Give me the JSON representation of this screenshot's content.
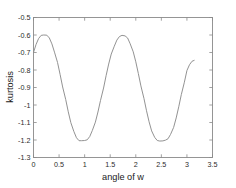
{
  "chart_data": {
    "type": "line",
    "title": "",
    "xlabel": "angle of w",
    "ylabel": "kurtosis",
    "xlim": [
      0,
      3.5
    ],
    "ylim": [
      -1.3,
      -0.5
    ],
    "grid": false,
    "legend": null,
    "xticks": [
      0,
      0.5,
      1,
      1.5,
      2,
      2.5,
      3,
      3.5
    ],
    "xtick_labels": [
      "0",
      "0.5",
      "1",
      "1.5",
      "2",
      "2.5",
      "3",
      "3.5"
    ],
    "yticks": [
      -1.3,
      -1.2,
      -1.1,
      -1,
      -0.9,
      -0.8,
      -0.7,
      -0.6,
      -0.5
    ],
    "ytick_labels": [
      "-1.3",
      "-1.2",
      "-1.1",
      "-1",
      "-0.9",
      "-0.8",
      "-0.7",
      "-0.6",
      "-0.5"
    ],
    "series": [
      {
        "name": "kurtosis",
        "color": "#8c8c8c",
        "x": [
          0.0,
          0.05,
          0.1,
          0.15,
          0.2,
          0.26,
          0.31,
          0.36,
          0.41,
          0.47,
          0.52,
          0.57,
          0.63,
          0.68,
          0.73,
          0.79,
          0.84,
          0.89,
          0.94,
          1.0,
          1.05,
          1.1,
          1.15,
          1.21,
          1.26,
          1.31,
          1.37,
          1.42,
          1.47,
          1.52,
          1.58,
          1.63,
          1.68,
          1.73,
          1.79,
          1.84,
          1.89,
          1.95,
          2.0,
          2.05,
          2.1,
          2.16,
          2.21,
          2.26,
          2.31,
          2.37,
          2.42,
          2.47,
          2.53,
          2.58,
          2.63,
          2.68,
          2.74,
          2.79,
          2.84,
          2.89,
          2.95,
          3.0,
          3.05,
          3.1,
          3.1416
        ],
        "y": [
          -0.7,
          -0.654,
          -0.62,
          -0.602,
          -0.6,
          -0.601,
          -0.617,
          -0.651,
          -0.698,
          -0.757,
          -0.825,
          -0.897,
          -0.969,
          -1.039,
          -1.101,
          -1.152,
          -1.187,
          -1.204,
          -1.204,
          -1.203,
          -1.199,
          -1.18,
          -1.146,
          -1.098,
          -1.04,
          -0.974,
          -0.903,
          -0.832,
          -0.766,
          -0.709,
          -0.664,
          -0.629,
          -0.609,
          -0.602,
          -0.605,
          -0.617,
          -0.65,
          -0.696,
          -0.753,
          -0.82,
          -0.891,
          -0.963,
          -1.033,
          -1.096,
          -1.148,
          -1.185,
          -1.203,
          -1.206,
          -1.205,
          -1.201,
          -1.193,
          -1.168,
          -1.128,
          -1.074,
          -1.01,
          -0.941,
          -0.87,
          -0.803,
          -0.77,
          -0.75,
          -0.745
        ]
      }
    ]
  },
  "axes": {
    "x_title": "angle of w",
    "y_title": "kurtosis"
  }
}
